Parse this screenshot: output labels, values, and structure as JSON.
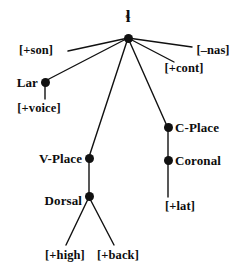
{
  "diagram": {
    "kind": "feature-geometry-tree",
    "root_symbol": "ɬ",
    "ink_color": "#111111",
    "background_color": "#ffffff",
    "nodes": {
      "root": {
        "label": "ɬ",
        "x": 128,
        "y": 38
      },
      "lar": {
        "label": "Lar",
        "x": 45,
        "y": 82
      },
      "vplace": {
        "label": "V-Place",
        "x": 89,
        "y": 158
      },
      "dorsal": {
        "label": "Dorsal",
        "x": 89,
        "y": 196
      },
      "cplace": {
        "label": "C-Place",
        "x": 168,
        "y": 127
      },
      "coronal": {
        "label": "Coronal",
        "x": 168,
        "y": 160
      }
    },
    "features": {
      "son": {
        "label": "[+son]",
        "x": 36,
        "y": 50
      },
      "nas": {
        "label": "[–nas]",
        "x": 213,
        "y": 50
      },
      "cont": {
        "label": "[+cont]",
        "x": 184,
        "y": 68
      },
      "voice": {
        "label": "[+voice]",
        "x": 39,
        "y": 108
      },
      "lat": {
        "label": "[+lat]",
        "x": 180,
        "y": 206
      },
      "high": {
        "label": "[+high]",
        "x": 65,
        "y": 255
      },
      "back": {
        "label": "[+back]",
        "x": 118,
        "y": 255
      }
    },
    "edges": [
      {
        "name": "root-to-son",
        "x1": 128,
        "y1": 38,
        "x2": 68,
        "y2": 51
      },
      {
        "name": "root-to-lar",
        "x1": 128,
        "y1": 38,
        "x2": 47,
        "y2": 80
      },
      {
        "name": "root-to-vplace",
        "x1": 128,
        "y1": 38,
        "x2": 89,
        "y2": 157
      },
      {
        "name": "root-to-cplace",
        "x1": 128,
        "y1": 38,
        "x2": 167,
        "y2": 126
      },
      {
        "name": "root-to-cont",
        "x1": 128,
        "y1": 38,
        "x2": 174,
        "y2": 62
      },
      {
        "name": "root-to-nas",
        "x1": 128,
        "y1": 38,
        "x2": 192,
        "y2": 47
      },
      {
        "name": "lar-to-voice",
        "x1": 45,
        "y1": 83,
        "x2": 45,
        "y2": 99
      },
      {
        "name": "vplace-to-dorsal",
        "x1": 89,
        "y1": 158,
        "x2": 89,
        "y2": 196
      },
      {
        "name": "dorsal-to-high",
        "x1": 89,
        "y1": 197,
        "x2": 66,
        "y2": 245
      },
      {
        "name": "dorsal-to-back",
        "x1": 89,
        "y1": 197,
        "x2": 114,
        "y2": 245
      },
      {
        "name": "cplace-to-coronal",
        "x1": 168,
        "y1": 127,
        "x2": 168,
        "y2": 160
      },
      {
        "name": "coronal-to-lat",
        "x1": 168,
        "y1": 161,
        "x2": 168,
        "y2": 197
      }
    ]
  }
}
